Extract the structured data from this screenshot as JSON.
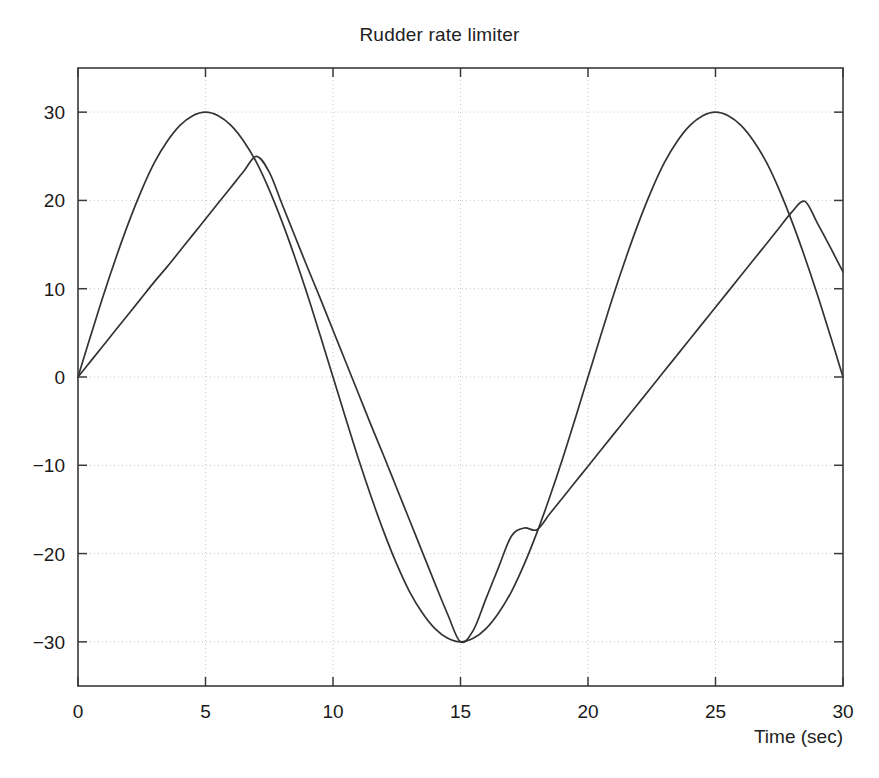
{
  "figure": {
    "title": "Rudder rate limiter",
    "background_color": "#ffffff",
    "line_color": "#333333",
    "grid_color": "#c9c9cf",
    "axis_color": "#3a3a3a"
  },
  "axes": {
    "xlabel": "Time (sec)",
    "ylabel": "",
    "x_ticks": [
      "0",
      "5",
      "10",
      "15",
      "20",
      "25",
      "30"
    ],
    "y_ticks": [
      "30",
      "20",
      "10",
      "0",
      "-10",
      "-20",
      "-30"
    ],
    "xlim": [
      0,
      30
    ],
    "ylim": [
      -35,
      35
    ],
    "grid": true
  },
  "chart_data": {
    "type": "line",
    "title": "Rudder rate limiter",
    "xlabel": "Time (sec)",
    "ylabel": "",
    "xlim": [
      0,
      30
    ],
    "ylim": [
      -35,
      35
    ],
    "x_ticks": [
      0,
      5,
      10,
      15,
      20,
      25,
      30
    ],
    "y_ticks": [
      -30,
      -20,
      -10,
      0,
      10,
      20,
      30
    ],
    "grid": true,
    "legend": null,
    "x": [
      0,
      0.5,
      1,
      1.5,
      2,
      2.5,
      3,
      3.5,
      4,
      4.5,
      5,
      5.5,
      6,
      6.5,
      7,
      7.5,
      8,
      8.5,
      9,
      9.5,
      10,
      10.5,
      11,
      11.5,
      12,
      12.5,
      13,
      13.5,
      14,
      14.5,
      15,
      15.5,
      16,
      16.5,
      17,
      17.5,
      18,
      18.5,
      19,
      19.5,
      20,
      20.5,
      21,
      21.5,
      22,
      22.5,
      23,
      23.5,
      24,
      24.5,
      25,
      25.5,
      26,
      26.5,
      27,
      27.5,
      28,
      28.5,
      29,
      29.5,
      30
    ],
    "series": [
      {
        "name": "Rudder command (sine input)",
        "description": "30*sin(2*pi*t/20), unlimited sinusoidal rudder demand",
        "values": [
          0.0,
          4.7,
          9.3,
          13.6,
          17.6,
          21.2,
          24.3,
          26.7,
          28.5,
          29.6,
          30.0,
          29.6,
          28.5,
          26.7,
          24.3,
          21.2,
          17.6,
          13.6,
          9.3,
          4.7,
          0.0,
          -4.7,
          -9.3,
          -13.6,
          -17.6,
          -21.2,
          -24.3,
          -26.7,
          -28.5,
          -29.6,
          -30.0,
          -29.6,
          -28.5,
          -26.7,
          -24.3,
          -21.2,
          -17.6,
          -13.6,
          -9.3,
          -4.7,
          0.0,
          4.7,
          9.3,
          13.6,
          17.6,
          21.2,
          24.3,
          26.7,
          28.5,
          29.6,
          30.0,
          29.6,
          28.5,
          26.7,
          24.3,
          21.2,
          17.6,
          13.6,
          9.3,
          4.7,
          0.0
        ]
      },
      {
        "name": "Rate limited rudder",
        "description": "Sine passed through a rate limiter of about +/- 3.6 deg/sec; tracks the sine until the slope limit binds, then ramps linearly",
        "values": [
          0.0,
          1.8,
          3.6,
          5.4,
          7.2,
          9.0,
          10.8,
          12.5,
          14.3,
          16.1,
          17.9,
          19.7,
          21.5,
          23.3,
          25.0,
          23.2,
          19.6,
          16.0,
          12.4,
          8.9,
          5.3,
          1.7,
          -1.9,
          -5.5,
          -9.0,
          -12.6,
          -16.2,
          -19.8,
          -23.4,
          -26.9,
          -30.0,
          -28.7,
          -25.1,
          -21.5,
          -18.0,
          -17.1,
          -17.3,
          -15.5,
          -13.7,
          -11.9,
          -10.1,
          -8.3,
          -6.5,
          -4.7,
          -2.9,
          -1.1,
          0.7,
          2.5,
          4.3,
          6.1,
          7.9,
          9.7,
          11.5,
          13.3,
          15.1,
          16.9,
          18.7,
          19.9,
          17.4,
          14.7,
          11.9
        ]
      }
    ]
  }
}
